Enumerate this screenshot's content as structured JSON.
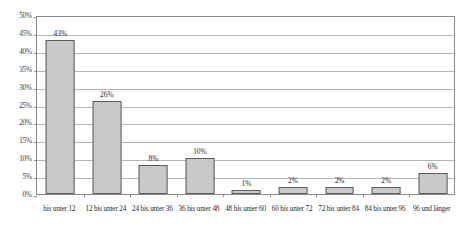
{
  "chart_data": {
    "type": "bar",
    "title": "",
    "subtitle": "",
    "xlabel": "",
    "ylabel": "",
    "categories": [
      "bis unter 12",
      "12 bis unter 24",
      "24 bis unter 36",
      "36 bis unter 48",
      "48 bis unter 60",
      "60 bis unter 72",
      "72 bis unter 84",
      "84 bis unter 96",
      "96 und länger"
    ],
    "values": [
      43,
      26,
      8,
      10,
      1,
      2,
      2,
      2,
      6
    ],
    "data_labels": [
      "43%",
      "26%",
      "8%",
      "10%",
      "1%",
      "2%",
      "2%",
      "2%",
      "6%"
    ],
    "ylim": [
      0,
      50
    ],
    "ytick_values": [
      0,
      5,
      10,
      15,
      20,
      25,
      30,
      35,
      40,
      45,
      50
    ],
    "ytick_labels": [
      "0%",
      "5%",
      "10%",
      "15%",
      "20%",
      "25%",
      "30%",
      "35%",
      "40%",
      "45%",
      "50%"
    ],
    "grid": true,
    "legend": false,
    "legend_position": "none",
    "bar_fill_color": "#c9c9c9",
    "bar_border_color": "#5d5d5d",
    "gridline_color": "#b5b5b5",
    "frame_color": "#8a8a8a",
    "text_color": "#2b2b2b",
    "background_color": "#ffffff"
  }
}
